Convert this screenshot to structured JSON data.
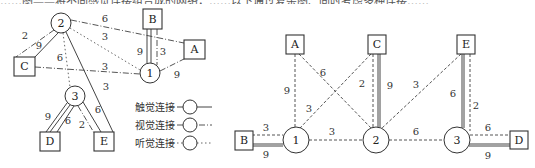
{
  "top_text": "……图——将不同感觉连接组合成的网络，……以下通过复杂图、同时考虑多种连接……",
  "left_diagram": {
    "nodes": [
      {
        "id": "2",
        "type": "circle"
      },
      {
        "id": "1",
        "type": "circle"
      },
      {
        "id": "3",
        "type": "circle"
      },
      {
        "id": "A",
        "type": "box"
      },
      {
        "id": "B",
        "type": "box"
      },
      {
        "id": "C",
        "type": "box"
      },
      {
        "id": "D",
        "type": "box"
      },
      {
        "id": "E",
        "type": "box"
      }
    ],
    "edges": [
      {
        "from": "2",
        "to": "C",
        "weight": "2",
        "kind": "visual"
      },
      {
        "from": "2",
        "to": "C",
        "weight": "9",
        "kind": "tactile"
      },
      {
        "from": "2",
        "to": "A",
        "weight": "6",
        "kind": "visual"
      },
      {
        "from": "2",
        "to": "1",
        "weight": "3",
        "kind": "audio"
      },
      {
        "from": "2",
        "to": "3",
        "weight": "6",
        "kind": "audio"
      },
      {
        "from": "2",
        "to": "E",
        "weight": "3",
        "kind": "tactile"
      },
      {
        "from": "C",
        "to": "1",
        "weight": "3",
        "kind": "visual"
      },
      {
        "from": "B",
        "to": "1",
        "weight": "9",
        "kind": "tactile"
      },
      {
        "from": "B",
        "to": "1",
        "weight": "3",
        "kind": "visual"
      },
      {
        "from": "1",
        "to": "A",
        "weight": "9",
        "kind": "visual"
      },
      {
        "from": "3",
        "to": "D",
        "weight": "9",
        "kind": "tactile"
      },
      {
        "from": "3",
        "to": "D",
        "weight": "6",
        "kind": "tactile"
      },
      {
        "from": "3",
        "to": "E",
        "weight": "2",
        "kind": "visual"
      },
      {
        "from": "3",
        "to": "E",
        "weight": "6",
        "kind": "tactile"
      }
    ],
    "labels": {
      "n2": "2",
      "n1": "1",
      "n3": "3",
      "A": "A",
      "B": "B",
      "C": "C",
      "D": "D",
      "E": "E",
      "w_2C_a": "2",
      "w_2C_b": "9",
      "w_2A": "6",
      "w_21": "3",
      "w_23": "6",
      "w_2E": "3",
      "w_C1": "3",
      "w_B1_t": "9",
      "w_B1_v": "3",
      "w_1A": "9",
      "w_3D_a": "9",
      "w_3D_b": "6",
      "w_3E_a": "2",
      "w_3E_b": "6"
    }
  },
  "legend": {
    "items": [
      {
        "label": "触觉连接",
        "style": "solid"
      },
      {
        "label": "视觉连接",
        "style": "dash-dot"
      },
      {
        "label": "听觉连接",
        "style": "dotted"
      }
    ]
  },
  "right_diagram": {
    "labels": {
      "n1": "1",
      "n2": "2",
      "n3": "3",
      "A": "A",
      "B": "B",
      "C": "C",
      "D": "D",
      "E": "E",
      "w_A1": "9",
      "w_A2": "6",
      "w_C1": "3",
      "w_C2_d": "2",
      "w_C2_s": "9",
      "w_E2": "3",
      "w_E3_s": "6",
      "w_E3_d": "2",
      "w_B1_d": "3",
      "w_B1_s": "9",
      "w_12": "3",
      "w_23": "6",
      "w_3D_d": "6",
      "w_3D_s": "9"
    }
  }
}
